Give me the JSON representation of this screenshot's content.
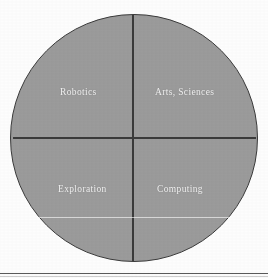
{
  "figure": {
    "type": "quadrant-circle-diagram",
    "shape": "circle divided into four quadrants by one horizontal and one vertical line",
    "fill_color": "#9c9c9c",
    "line_color": "#3a3a3a",
    "label_color": "#f2f2f2",
    "background_color": "#fdfdfd"
  },
  "chart_data": {
    "type": "pie",
    "title": "",
    "categories": [
      "Robotics",
      "Arts, Sciences",
      "Exploration",
      "Computing"
    ],
    "values": [
      25,
      25,
      25,
      25
    ],
    "legend": "none",
    "annotations": [
      "faint light horizontal chord across lower half"
    ]
  },
  "quadrants": {
    "top_left": {
      "label": "Robotics"
    },
    "top_right": {
      "label": "Arts, Sciences"
    },
    "bottom_left": {
      "label": "Exploration"
    },
    "bottom_right": {
      "label": "Computing"
    }
  }
}
